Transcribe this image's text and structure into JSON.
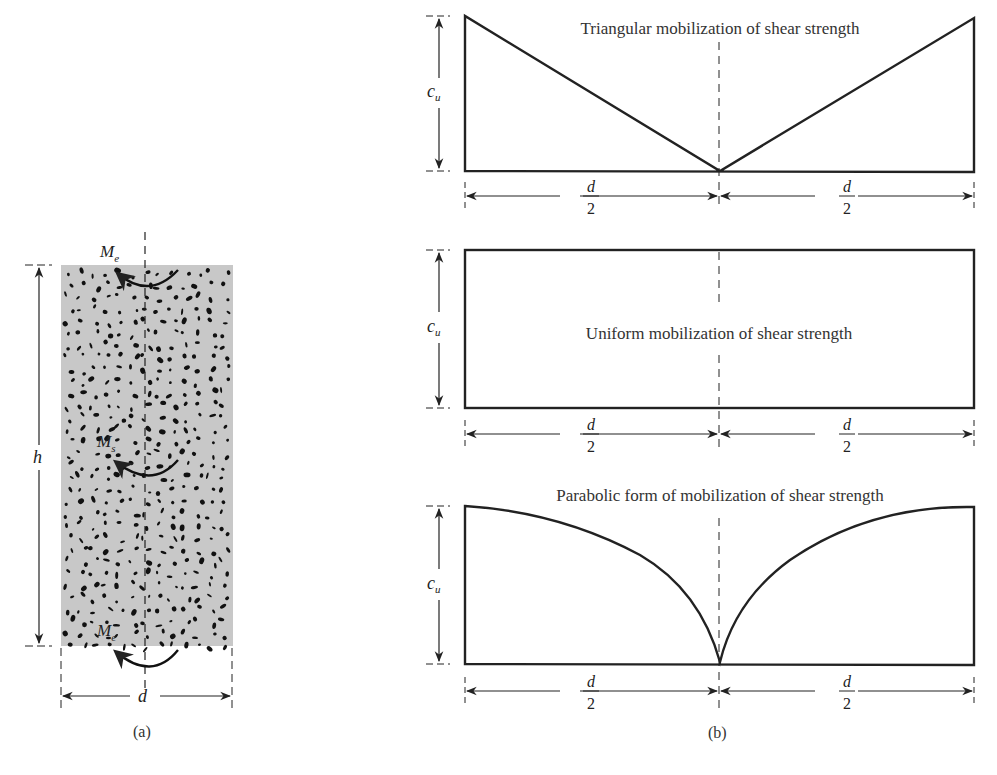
{
  "figure": {
    "panel_a": {
      "caption": "(a)",
      "moment_top": {
        "symbol": "M",
        "subscript": "e"
      },
      "moment_middle": {
        "symbol": "M",
        "subscript": "s"
      },
      "moment_bottom": {
        "symbol": "M",
        "subscript": "e"
      },
      "height_label": "h",
      "width_label": "d",
      "fill_color": "#c8c8c8",
      "speckle_color": "#111111"
    },
    "panel_b": {
      "caption": "(b)",
      "diagrams": [
        {
          "title": "Triangular mobilization of shear strength",
          "shape": "triangular",
          "height_label": {
            "symbol": "c",
            "subscript": "u"
          },
          "half_width_label": {
            "numerator": "d",
            "denominator": "2"
          }
        },
        {
          "title": "Uniform mobilization of shear strength",
          "shape": "uniform",
          "height_label": {
            "symbol": "c",
            "subscript": "u"
          },
          "half_width_label": {
            "numerator": "d",
            "denominator": "2"
          }
        },
        {
          "title": "Parabolic form of mobilization of shear strength",
          "shape": "parabolic",
          "height_label": {
            "symbol": "c",
            "subscript": "u"
          },
          "half_width_label": {
            "numerator": "d",
            "denominator": "2"
          }
        }
      ]
    },
    "line_color": "#222222"
  }
}
